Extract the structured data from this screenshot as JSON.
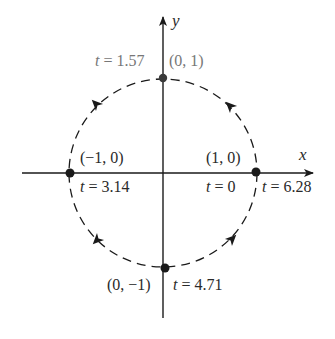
{
  "diagram": {
    "type": "parametric-unit-circle",
    "direction": "counterclockwise",
    "axes": {
      "x_label": "x",
      "y_label": "y"
    },
    "points": {
      "top": {
        "coord": "(0, 1)",
        "t_var": "t",
        "t_eq": " = 1.57"
      },
      "left": {
        "coord": "(−1, 0)",
        "t_var": "t",
        "t_eq": " = 3.14"
      },
      "right": {
        "coord": "(1, 0)",
        "t_start_var": "t",
        "t_start_eq": " = 0",
        "t_end_var": "t",
        "t_end_eq": " = 6.28"
      },
      "bottom": {
        "coord": "(0, −1)",
        "t_var": "t",
        "t_eq": " = 4.71"
      }
    },
    "colors": {
      "stroke": "#1a1a1a",
      "top_label": "#777777",
      "background": "#ffffff"
    }
  }
}
